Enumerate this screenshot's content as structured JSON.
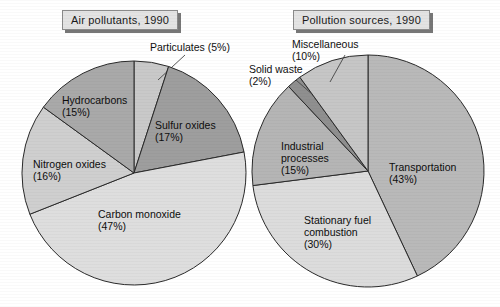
{
  "page": {
    "background": "#ffffff",
    "width": 500,
    "height": 307
  },
  "panels": [
    {
      "id": "air-pollutants",
      "title": "Air pollutants, 1990",
      "title_box": {
        "x": 62,
        "y": 10,
        "fill": "#e3e3e3",
        "border": "#8a8a8a",
        "shadow": "#777777"
      }
    },
    {
      "id": "pollution-sources",
      "title": "Pollution sources, 1990",
      "title_box": {
        "x": 293,
        "y": 10,
        "fill": "#e3e3e3",
        "border": "#8a8a8a",
        "shadow": "#777777"
      }
    }
  ],
  "chart_data": [
    {
      "type": "pie",
      "title": "Air pollutants, 1990",
      "center": [
        134,
        173
      ],
      "radius": 112,
      "start_angle_deg": 0,
      "direction": "clockwise",
      "legend": "none",
      "grid": false,
      "categories": [
        "Particulates",
        "Sulfur oxides",
        "Carbon monoxide",
        "Nitrogen oxides",
        "Hydrocarbons"
      ],
      "values": [
        5,
        17,
        47,
        16,
        15
      ],
      "unit": "%",
      "slices": [
        {
          "label": "Particulates",
          "value": 5,
          "value_text": "(5%)",
          "color": "#c9c9c9",
          "label_placement": "outside",
          "label_x": 150,
          "label_y": 41,
          "leader": {
            "x1": 185,
            "y1": 55,
            "x2": 158,
            "y2": 80
          }
        },
        {
          "label": "Sulfur oxides",
          "value": 17,
          "value_text": "(17%)",
          "color": "#9e9e9e",
          "label_placement": "inside",
          "label_x": 155,
          "label_y": 119
        },
        {
          "label": "Carbon monoxide",
          "value": 47,
          "value_text": "(47%)",
          "color": "#dedede",
          "label_placement": "inside",
          "label_x": 98,
          "label_y": 208
        },
        {
          "label": "Nitrogen oxides",
          "value": 16,
          "value_text": "(16%)",
          "color": "#cfcfcf",
          "label_placement": "inside",
          "label_x": 33,
          "label_y": 158
        },
        {
          "label": "Hydrocarbons",
          "value": 15,
          "value_text": "(15%)",
          "color": "#a9a9a9",
          "label_placement": "inside",
          "label_x": 62,
          "label_y": 94
        }
      ]
    },
    {
      "type": "pie",
      "title": "Pollution sources, 1990",
      "center": [
        368,
        171
      ],
      "radius": 116,
      "start_angle_deg": 0,
      "direction": "clockwise",
      "legend": "none",
      "grid": false,
      "categories": [
        "Transportation",
        "Stationary fuel combustion",
        "Industrial processes",
        "Solid waste",
        "Miscellaneous"
      ],
      "values": [
        43,
        30,
        15,
        2,
        10
      ],
      "unit": "%",
      "slices": [
        {
          "label": "Transportation",
          "value": 43,
          "value_text": "(43%)",
          "color": "#b9b9b9",
          "label_placement": "inside",
          "label_x": 389,
          "label_y": 161
        },
        {
          "label": "Stationary fuel combustion",
          "value": 30,
          "value_text": "(30%)",
          "color": "#dcdcdc",
          "label_placement": "inside",
          "label_x": 304,
          "label_y": 214
        },
        {
          "label": "Industrial processes",
          "value": 15,
          "value_text": "(15%)",
          "color": "#b5b5b5",
          "label_placement": "inside",
          "label_x": 281,
          "label_y": 140
        },
        {
          "label": "Solid waste",
          "value": 2,
          "value_text": "(2%)",
          "color": "#8f8f8f",
          "label_placement": "outside",
          "label_x": 249,
          "label_y": 63,
          "leader": {
            "x1": 296,
            "y1": 80,
            "x2": 313,
            "y2": 95
          }
        },
        {
          "label": "Miscellaneous",
          "value": 10,
          "value_text": "(10%)",
          "color": "#c6c6c6",
          "label_placement": "outside",
          "label_x": 292,
          "label_y": 38,
          "leader": {
            "x1": 345,
            "y1": 55,
            "x2": 330,
            "y2": 82
          }
        }
      ]
    }
  ],
  "style": {
    "stroke": "#2a2a2a",
    "stroke_width": 1,
    "text_color": "#101010",
    "leader_color": "#444444"
  }
}
